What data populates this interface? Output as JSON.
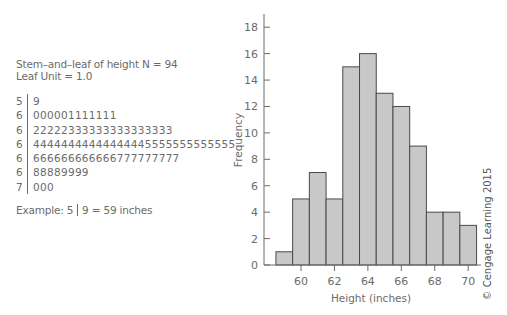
{
  "stem_and_leaf": {
    "title": "Stem–and–leaf of height N = 94",
    "leaf_unit": "Leaf Unit = 1.0",
    "rows": [
      {
        "stem": "5",
        "leaves": "9"
      },
      {
        "stem": "6",
        "leaves": "000001111111"
      },
      {
        "stem": "6",
        "leaves": "22222333333333333333"
      },
      {
        "stem": "6",
        "leaves": "44444444444444445555555555555"
      },
      {
        "stem": "6",
        "leaves": "666666666666777777777"
      },
      {
        "stem": "6",
        "leaves": "88889999"
      },
      {
        "stem": "7",
        "leaves": "000"
      }
    ],
    "example_prefix": "Example: 5",
    "example_suffix": "9 = 59 inches"
  },
  "copyright": "© Cengage Learning 2015",
  "chart_data": {
    "type": "bar",
    "title": "",
    "xlabel": "Height (inches)",
    "ylabel": "Frequency",
    "categories": [
      59,
      60,
      61,
      62,
      63,
      64,
      65,
      66,
      67,
      68,
      69,
      70
    ],
    "values": [
      1,
      5,
      7,
      5,
      15,
      16,
      13,
      12,
      9,
      4,
      4,
      3
    ],
    "x_ticks": [
      60,
      62,
      64,
      66,
      68,
      70
    ],
    "y_ticks": [
      0,
      2,
      4,
      6,
      8,
      10,
      12,
      14,
      16,
      18
    ],
    "xlim": [
      57.2,
      71.1
    ],
    "ylim": [
      0,
      19
    ],
    "grid": false,
    "bar_color": "#c8c8c8",
    "edge_color": "#4a4a4a"
  }
}
